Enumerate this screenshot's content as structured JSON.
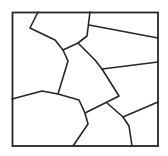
{
  "diagram": {
    "type": "voronoi-tessellation",
    "stroke_color": "#262626",
    "background": "#ffffff",
    "frame": {
      "x": 12.5,
      "y": 12.5,
      "width": 145.5,
      "height": 133.5
    },
    "edges": [
      {
        "id": "e1",
        "points": [
          [
            38,
            12
          ],
          [
            30,
            28
          ],
          [
            55,
            40
          ],
          [
            63,
            50
          ]
        ]
      },
      {
        "id": "e2",
        "points": [
          [
            63,
            50
          ],
          [
            78,
            43
          ],
          [
            87,
            36
          ],
          [
            90,
            12
          ]
        ]
      },
      {
        "id": "e3",
        "points": [
          [
            89,
            25
          ],
          [
            158,
            38
          ]
        ]
      },
      {
        "id": "e4",
        "points": [
          [
            63,
            50
          ],
          [
            68,
            61
          ],
          [
            58,
            94
          ]
        ]
      },
      {
        "id": "e5",
        "points": [
          [
            78,
            43
          ],
          [
            95,
            60
          ],
          [
            102,
            69
          ],
          [
            119,
            96
          ],
          [
            85,
            113
          ]
        ]
      },
      {
        "id": "e6",
        "points": [
          [
            102,
            69
          ],
          [
            158,
            62
          ]
        ]
      },
      {
        "id": "e7",
        "points": [
          [
            12,
            99
          ],
          [
            42,
            91
          ],
          [
            58,
            94
          ],
          [
            79,
            100
          ],
          [
            85,
            113
          ],
          [
            88,
            124
          ],
          [
            73,
            146
          ]
        ]
      },
      {
        "id": "e8",
        "points": [
          [
            107,
            103
          ],
          [
            123,
            117
          ],
          [
            158,
            102
          ]
        ]
      },
      {
        "id": "e9",
        "points": [
          [
            123,
            117
          ],
          [
            129,
            126
          ],
          [
            132,
            146
          ]
        ]
      }
    ]
  }
}
